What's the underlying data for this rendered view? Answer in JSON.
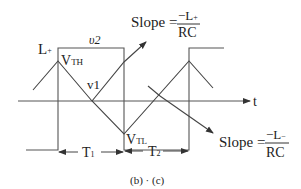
{
  "figure": {
    "caption": "(b) · (c)",
    "axis_label": "t",
    "waveforms": {
      "square_label": "υ2",
      "triangle_label": "v1"
    },
    "levels": {
      "high": "L",
      "high_sub": "+",
      "vth_main": "V",
      "vth_sub": "TH",
      "vtl_main": "V",
      "vtl_sub": "TL"
    },
    "intervals": {
      "t1_main": "T",
      "t1_sub": "1",
      "t2_main": "T",
      "t2_sub": "2"
    },
    "slope_top": {
      "prefix": "Slope =",
      "numerator": "−L",
      "numerator_sub": "+",
      "denominator": "RC"
    },
    "slope_bottom": {
      "prefix": "Slope =",
      "numerator": "−L",
      "numerator_sub": "−",
      "denominator": "RC"
    },
    "colors": {
      "line": "#444444",
      "text": "#222222",
      "background": "#ffffff"
    }
  }
}
